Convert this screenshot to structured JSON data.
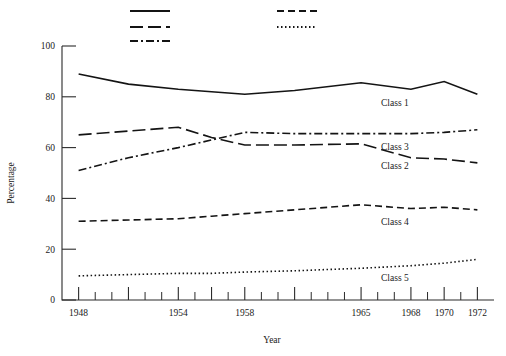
{
  "figure": {
    "background_color": "#ffffff",
    "ink_color": "#141414"
  },
  "axes": {
    "x_title": "Year",
    "y_title": "Percentage"
  },
  "legend": {
    "entries": [
      {
        "name": "legend-solid",
        "style": "solid",
        "dasharray": "none",
        "col": 0,
        "row": 0
      },
      {
        "name": "legend-long-dash",
        "style": "long-dash",
        "dasharray": "13,5",
        "col": 0,
        "row": 1
      },
      {
        "name": "legend-dash-dot",
        "style": "dash-dot",
        "dasharray": "8,3,2,3",
        "col": 0,
        "row": 2
      },
      {
        "name": "legend-medium-dash",
        "style": "medium-dash",
        "dasharray": "7,4",
        "col": 1,
        "row": 0
      },
      {
        "name": "legend-dotted",
        "style": "dotted",
        "dasharray": "1.5,2.5",
        "col": 1,
        "row": 1
      }
    ]
  },
  "caption": {
    "text": ""
  },
  "chart_data": {
    "type": "line",
    "title": "",
    "xlabel": "Year",
    "ylabel": "Percentage",
    "xlim": [
      1947,
      1973
    ],
    "ylim": [
      0,
      100
    ],
    "y_ticks": [
      0,
      20,
      40,
      60,
      80,
      100
    ],
    "x_tick_labels": [
      1948,
      1954,
      1958,
      1965,
      1968,
      1970,
      1972
    ],
    "x_major_ticks": [
      1948,
      1951,
      1954,
      1956,
      1958,
      1961,
      1965,
      1968,
      1970,
      1972
    ],
    "x_minor_ticks": [
      1949,
      1950,
      1952,
      1953,
      1955,
      1957,
      1959,
      1960,
      1962,
      1963,
      1964,
      1966,
      1967,
      1969,
      1971
    ],
    "grid": false,
    "legend_position": "top",
    "x": [
      1948,
      1951,
      1954,
      1956,
      1958,
      1961,
      1965,
      1968,
      1970,
      1972
    ],
    "series": [
      {
        "name": "Class 1",
        "style": "solid",
        "dasharray": "none",
        "label": "Class 1",
        "label_x": 1966.2,
        "label_y": 76.5,
        "values": [
          89,
          85,
          83,
          82,
          81,
          82.5,
          85.5,
          83,
          86,
          81
        ]
      },
      {
        "name": "Class 2",
        "style": "long-dash",
        "dasharray": "13,5",
        "label": "Class 2",
        "label_x": 1966.2,
        "label_y": 51.5,
        "values": [
          65,
          66.5,
          68,
          64,
          61,
          61,
          61.5,
          56,
          55.5,
          54
        ]
      },
      {
        "name": "Class 3",
        "style": "dash-dot",
        "dasharray": "8,3,2,3",
        "label": "Class 3",
        "label_x": 1966.2,
        "label_y": 59.0,
        "values": [
          51,
          56,
          60,
          63,
          66,
          65.5,
          65.5,
          65.5,
          66,
          67
        ]
      },
      {
        "name": "Class 4",
        "style": "medium-dash",
        "dasharray": "7,4",
        "label": "Class 4",
        "label_x": 1966.2,
        "label_y": 29.5,
        "values": [
          31,
          31.5,
          32,
          33,
          34,
          35.5,
          37.5,
          36,
          36.5,
          35.5
        ]
      },
      {
        "name": "Class 5",
        "style": "dotted",
        "dasharray": "1.5,2.5",
        "label": "Class 5",
        "label_x": 1966.2,
        "label_y": 7.5,
        "values": [
          9.5,
          10,
          10.5,
          10.5,
          11,
          11.5,
          12.5,
          13.5,
          14.5,
          16
        ]
      }
    ]
  }
}
